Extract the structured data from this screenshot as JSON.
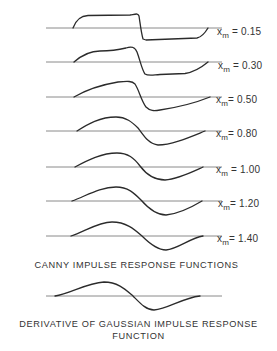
{
  "figure": {
    "panels": [
      {
        "var": "x",
        "sub": "m",
        "eq": "= 0.15",
        "baseline_y": 28
      },
      {
        "var": "x",
        "sub": "m",
        "eq": "= 0.30",
        "baseline_y": 62
      },
      {
        "var": "x",
        "sub": "m",
        "eq": "= 0.50",
        "baseline_y": 97
      },
      {
        "var": "x",
        "sub": "m",
        "eq": "= 0.80",
        "baseline_y": 131
      },
      {
        "var": "x",
        "sub": "m",
        "eq": "= 1.00",
        "baseline_y": 167
      },
      {
        "var": "x",
        "sub": "m",
        "eq": "= 1.20",
        "baseline_y": 201
      },
      {
        "var": "x",
        "sub": "m",
        "eq": "= 1.40",
        "baseline_y": 236
      }
    ],
    "canny_caption": "CANNY IMPULSE RESPONSE FUNCTIONS",
    "gaussian_caption_line1": "DERIVATIVE OF GAUSSIAN IMPULSE RESPONSE",
    "gaussian_caption_line2": "FUNCTION",
    "colors": {
      "curve": "#2b2b2b",
      "baseline": "#8a8a8a",
      "background": "#ffffff"
    }
  }
}
